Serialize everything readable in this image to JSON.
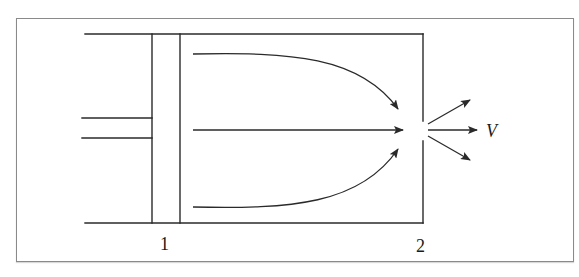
{
  "diagram": {
    "type": "piston-cylinder-nozzle-flow",
    "labels": {
      "section_1": "1",
      "section_2": "2",
      "velocity": "V"
    },
    "colors": {
      "stroke": "#2a2a2a",
      "frame_border": "#8a8a8a",
      "background": "#ffffff"
    },
    "components": [
      "cylinder",
      "piston",
      "piston-rod",
      "outlet-orifice",
      "converging-streamlines",
      "diverging-exit-jets"
    ]
  }
}
